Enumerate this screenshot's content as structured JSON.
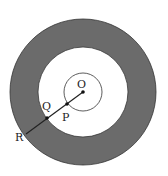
{
  "diagram": {
    "type": "concentric-circles",
    "center": {
      "x": 83,
      "y": 92
    },
    "circles": [
      {
        "name": "outer",
        "r": 73,
        "fill": "#6b6b6b"
      },
      {
        "name": "middle",
        "r": 45,
        "fill": "#ffffff"
      },
      {
        "name": "inner",
        "r": 19,
        "fill": "none"
      }
    ],
    "points": [
      {
        "label": "O",
        "x": 83,
        "y": 92,
        "lx": 77,
        "ly": 88
      },
      {
        "label": "P",
        "x": 67,
        "y": 104,
        "lx": 62,
        "ly": 121
      },
      {
        "label": "Q",
        "x": 47,
        "y": 118,
        "lx": 42,
        "ly": 110
      },
      {
        "label": "R",
        "x": 26,
        "y": 134,
        "lx": 15,
        "ly": 141
      }
    ],
    "colors": {
      "shaded": "#6b6b6b",
      "line": "#222222"
    }
  }
}
